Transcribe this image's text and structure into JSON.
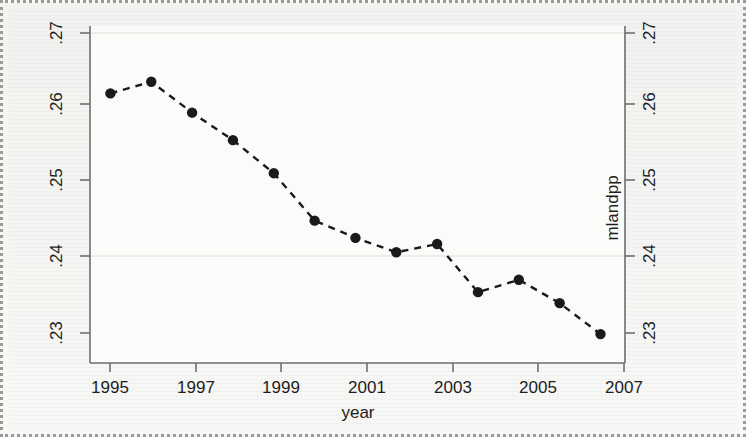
{
  "chart_data": {
    "type": "line",
    "title": "",
    "subtitle": "",
    "xlabel": "year",
    "ylabel": "mlandpp",
    "ylabel_right": "mlandpp",
    "x": [
      1995,
      1996,
      1997,
      1998,
      1999,
      2000,
      2001,
      2002,
      2003,
      2004,
      2005,
      2006,
      2007
    ],
    "values": [
      0.2637,
      0.2654,
      0.2609,
      0.2569,
      0.2521,
      0.2452,
      0.2427,
      0.2406,
      0.2418,
      0.2348,
      0.2366,
      0.2332,
      0.2287
    ],
    "series": [
      {
        "name": "mlandpp",
        "values": [
          0.2637,
          0.2654,
          0.2609,
          0.2569,
          0.2521,
          0.2452,
          0.2427,
          0.2406,
          0.2418,
          0.2348,
          0.2366,
          0.2332,
          0.2287
        ]
      }
    ],
    "xlim": [
      1994.5,
      2007.6
    ],
    "ylim": [
      0.2245,
      0.2735
    ],
    "xticks": [
      1995,
      1997,
      1999,
      2001,
      2003,
      2005,
      2007
    ],
    "xtick_labels": [
      "1995",
      "1997",
      "1999",
      "2001",
      "2003",
      "2005",
      "2007"
    ],
    "yticks": [
      0.23,
      0.24,
      0.25,
      0.26,
      0.27
    ],
    "ytick_labels": [
      ".23",
      ".24",
      ".25",
      ".26",
      ".27"
    ],
    "ytick_labels_right": [
      ".23",
      ".24",
      ".25",
      ".26",
      ".27"
    ],
    "grid": "horizontal-faint",
    "gridlines_at": [
      0.24,
      0.27
    ],
    "legend": "none",
    "line_style": "dashed",
    "marker": "filled-circle",
    "line_color": "#1a1a1a",
    "marker_color": "#1a1a1a",
    "axis_color": "#6e6e6e",
    "background_color": "#f3f3f1",
    "plot_background_color": "#fbfbfa"
  },
  "figure": {
    "x_axis_title": "year",
    "y_axis_title_right": "mlandpp"
  }
}
